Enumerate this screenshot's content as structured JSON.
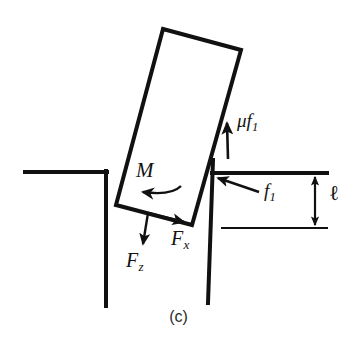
{
  "figure": {
    "caption": "(c)",
    "background_color": "#ffffff",
    "ink_color": "#111111",
    "labels": {
      "moment": "M",
      "moment_sub": "",
      "friction_upper_base": "μf",
      "friction_upper_sub": "1",
      "normal_force_base": "f",
      "normal_force_sub": "1",
      "depth": "ℓ",
      "force_z_base": "F",
      "force_z_sub": "z",
      "force_x_base": "F",
      "force_x_sub": "x"
    },
    "geometry": {
      "block": {
        "name": "tilted-rectangular-block",
        "corners": [
          [
            163,
            29
          ],
          [
            241,
            50
          ],
          [
            192,
            225
          ],
          [
            116,
            205
          ]
        ],
        "stroke_width": 4
      },
      "left_step": {
        "name": "left-step-surface",
        "horizontal": [
          [
            25,
            172
          ],
          [
            106,
            172
          ]
        ],
        "vertical": [
          [
            106,
            172
          ],
          [
            106,
            306
          ]
        ],
        "stroke_width": 4
      },
      "right_step": {
        "name": "right-step-surface",
        "wall": [
          [
            213,
            160
          ],
          [
            208,
            303
          ]
        ],
        "horizontal": [
          [
            213,
            173
          ],
          [
            326,
            173
          ]
        ],
        "stroke_width": 4
      },
      "lower_reference_line": {
        "name": "lower-reference-line",
        "points": [
          [
            222,
            228
          ],
          [
            327,
            228
          ]
        ],
        "stroke_width": 2
      },
      "dimension_arrow": {
        "name": "depth-dimension-arrow",
        "x": 315,
        "y_top": 175,
        "y_bottom": 227,
        "double_headed": true
      },
      "arrows": [
        {
          "name": "friction-force-arrow",
          "from": [
            228,
            159
          ],
          "to": [
            227,
            121
          ]
        },
        {
          "name": "normal-force-arrow",
          "from": [
            259,
            192
          ],
          "to": [
            216,
            178
          ]
        },
        {
          "name": "force-z-arrow",
          "from": [
            148,
            214
          ],
          "to": [
            142,
            246
          ]
        },
        {
          "name": "force-x-arrow",
          "from": [
            148,
            214
          ],
          "to": [
            186,
            223
          ]
        },
        {
          "name": "moment-curved-arrow",
          "from": [
            180,
            188
          ],
          "to": [
            140,
            192
          ]
        }
      ]
    }
  }
}
